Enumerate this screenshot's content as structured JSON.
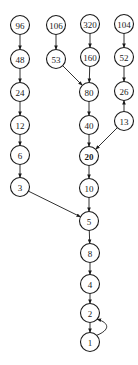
{
  "diagram": {
    "title": "",
    "node_radius": 9.5,
    "stroke_color": "#1a1a1a",
    "nodes": [
      {
        "id": "n96",
        "label": "96",
        "x": 20,
        "y": 25
      },
      {
        "id": "n48",
        "label": "48",
        "x": 20,
        "y": 59
      },
      {
        "id": "n24",
        "label": "24",
        "x": 20,
        "y": 92
      },
      {
        "id": "n12",
        "label": "12",
        "x": 20,
        "y": 125
      },
      {
        "id": "n6",
        "label": "6",
        "x": 20,
        "y": 155
      },
      {
        "id": "n3",
        "label": "3",
        "x": 20,
        "y": 187
      },
      {
        "id": "n106",
        "label": "106",
        "x": 56,
        "y": 25
      },
      {
        "id": "n53",
        "label": "53",
        "x": 56,
        "y": 59
      },
      {
        "id": "n320",
        "label": "320",
        "x": 90,
        "y": 24
      },
      {
        "id": "n160",
        "label": "160",
        "x": 90,
        "y": 57
      },
      {
        "id": "n80",
        "label": "80",
        "x": 89,
        "y": 92
      },
      {
        "id": "n40",
        "label": "40",
        "x": 89,
        "y": 125
      },
      {
        "id": "n20",
        "label": "20",
        "x": 89,
        "y": 156,
        "bold": true
      },
      {
        "id": "n10",
        "label": "10",
        "x": 89,
        "y": 188
      },
      {
        "id": "n5",
        "label": "5",
        "x": 89,
        "y": 221
      },
      {
        "id": "n8",
        "label": "8",
        "x": 90,
        "y": 253
      },
      {
        "id": "n4",
        "label": "4",
        "x": 90,
        "y": 284
      },
      {
        "id": "n2",
        "label": "2",
        "x": 90,
        "y": 313
      },
      {
        "id": "n1",
        "label": "1",
        "x": 90,
        "y": 342
      },
      {
        "id": "n104",
        "label": "104",
        "x": 124,
        "y": 24
      },
      {
        "id": "n52",
        "label": "52",
        "x": 124,
        "y": 57
      },
      {
        "id": "n26",
        "label": "26",
        "x": 124,
        "y": 91
      },
      {
        "id": "n13",
        "label": "13",
        "x": 124,
        "y": 121
      }
    ],
    "edges": [
      {
        "from": "n96",
        "to": "n48"
      },
      {
        "from": "n48",
        "to": "n24"
      },
      {
        "from": "n24",
        "to": "n12"
      },
      {
        "from": "n12",
        "to": "n6"
      },
      {
        "from": "n6",
        "to": "n3"
      },
      {
        "from": "n3",
        "to": "n5"
      },
      {
        "from": "n106",
        "to": "n53"
      },
      {
        "from": "n53",
        "to": "n80"
      },
      {
        "from": "n320",
        "to": "n160"
      },
      {
        "from": "n160",
        "to": "n80"
      },
      {
        "from": "n80",
        "to": "n40"
      },
      {
        "from": "n40",
        "to": "n20"
      },
      {
        "from": "n13",
        "to": "n20"
      },
      {
        "from": "n20",
        "to": "n10"
      },
      {
        "from": "n10",
        "to": "n5"
      },
      {
        "from": "n5",
        "to": "n8"
      },
      {
        "from": "n8",
        "to": "n4"
      },
      {
        "from": "n4",
        "to": "n2"
      },
      {
        "from": "n2",
        "to": "n1"
      },
      {
        "from": "n1",
        "to": "n2",
        "curved": true
      },
      {
        "from": "n104",
        "to": "n52"
      },
      {
        "from": "n52",
        "to": "n26"
      },
      {
        "from": "n13",
        "to": "n26"
      }
    ]
  }
}
